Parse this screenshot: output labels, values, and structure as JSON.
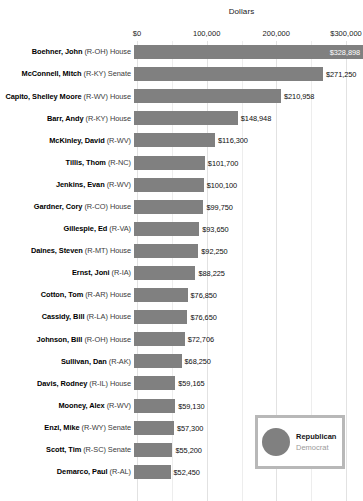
{
  "chart_data": {
    "type": "bar",
    "orientation": "horizontal",
    "title": "Dollars",
    "xlabel": "Dollars",
    "ylabel": "",
    "xlim": [
      0,
      300000
    ],
    "grid": true,
    "axis_position": "top",
    "tick_labels": [
      "$0",
      "100,000",
      "200,000",
      "$300,000"
    ],
    "tick_values": [
      0,
      100000,
      200000,
      300000
    ],
    "legend": {
      "position": "bottom-right",
      "entries": [
        {
          "label": "Republican",
          "color": "#808080",
          "active": true
        },
        {
          "label": "Democrat",
          "color": "#c8c8c8",
          "active": false
        }
      ]
    },
    "categories": [
      "Boehner, John (R-OH) House",
      "McConnell, Mitch (R-KY) Senate",
      "Capito, Shelley Moore (R-WV) House",
      "Barr, Andy (R-KY) House",
      "McKinley, David (R-WV)",
      "Tillis, Thom (R-NC)",
      "Jenkins, Evan (R-WV)",
      "Gardner, Cory (R-CO) House",
      "Gillespie, Ed (R-VA)",
      "Daines, Steven (R-MT) House",
      "Ernst, Joni (R-IA)",
      "Cotton, Tom (R-AR) House",
      "Cassidy, Bill (R-LA) House",
      "Johnson, Bill (R-OH) House",
      "Sullivan, Dan (R-AK)",
      "Davis, Rodney (R-IL) House",
      "Mooney, Alex (R-WV)",
      "Enzi, Mike (R-WY) Senate",
      "Scott, Tim (R-SC) Senate",
      "Demarco, Paul (R-AL)"
    ],
    "values": [
      328898,
      271250,
      210958,
      148948,
      116300,
      101700,
      100100,
      99750,
      93650,
      92250,
      88225,
      76850,
      76650,
      72706,
      68250,
      59165,
      59130,
      57300,
      55200,
      52450
    ],
    "value_labels": [
      "$328,898",
      "$271,250",
      "$210,958",
      "$148,948",
      "$116,300",
      "$101,700",
      "$100,100",
      "$99,750",
      "$93,650",
      "$92,250",
      "$88,225",
      "$76,850",
      "$76,650",
      "$72,706",
      "$68,250",
      "$59,165",
      "$59,130",
      "$57,300",
      "$55,200",
      "$52,450"
    ],
    "bar_color": "#808080"
  },
  "rows": [
    {
      "name": "Boehner, John",
      "party": "(R-OH) House",
      "value": 328898,
      "value_label": "$328,898",
      "label_inside": true
    },
    {
      "name": "McConnell, Mitch",
      "party": "(R-KY) Senate",
      "value": 271250,
      "value_label": "$271,250",
      "label_inside": false
    },
    {
      "name": "Capito, Shelley Moore",
      "party": "(R-WV) House",
      "value": 210958,
      "value_label": "$210,958",
      "label_inside": false
    },
    {
      "name": "Barr, Andy",
      "party": "(R-KY) House",
      "value": 148948,
      "value_label": "$148,948",
      "label_inside": false
    },
    {
      "name": "McKinley, David",
      "party": "(R-WV)",
      "value": 116300,
      "value_label": "$116,300",
      "label_inside": false
    },
    {
      "name": "Tillis, Thom",
      "party": "(R-NC)",
      "value": 101700,
      "value_label": "$101,700",
      "label_inside": false
    },
    {
      "name": "Jenkins, Evan",
      "party": "(R-WV)",
      "value": 100100,
      "value_label": "$100,100",
      "label_inside": false
    },
    {
      "name": "Gardner, Cory",
      "party": "(R-CO) House",
      "value": 99750,
      "value_label": "$99,750",
      "label_inside": false
    },
    {
      "name": "Gillespie, Ed",
      "party": "(R-VA)",
      "value": 93650,
      "value_label": "$93,650",
      "label_inside": false
    },
    {
      "name": "Daines, Steven",
      "party": "(R-MT) House",
      "value": 92250,
      "value_label": "$92,250",
      "label_inside": false
    },
    {
      "name": "Ernst, Joni",
      "party": "(R-IA)",
      "value": 88225,
      "value_label": "$88,225",
      "label_inside": false
    },
    {
      "name": "Cotton, Tom",
      "party": "(R-AR) House",
      "value": 76850,
      "value_label": "$76,850",
      "label_inside": false
    },
    {
      "name": "Cassidy, Bill",
      "party": "(R-LA) House",
      "value": 76650,
      "value_label": "$76,650",
      "label_inside": false
    },
    {
      "name": "Johnson, Bill",
      "party": "(R-OH) House",
      "value": 72706,
      "value_label": "$72,706",
      "label_inside": false
    },
    {
      "name": "Sullivan, Dan",
      "party": "(R-AK)",
      "value": 68250,
      "value_label": "$68,250",
      "label_inside": false
    },
    {
      "name": "Davis, Rodney",
      "party": "(R-IL) House",
      "value": 59165,
      "value_label": "$59,165",
      "label_inside": false
    },
    {
      "name": "Mooney, Alex",
      "party": "(R-WV)",
      "value": 59130,
      "value_label": "$59,130",
      "label_inside": false
    },
    {
      "name": "Enzi, Mike",
      "party": "(R-WY) Senate",
      "value": 57300,
      "value_label": "$57,300",
      "label_inside": false
    },
    {
      "name": "Scott, Tim",
      "party": "(R-SC) Senate",
      "value": 55200,
      "value_label": "$55,200",
      "label_inside": false
    },
    {
      "name": "Demarco, Paul",
      "party": "(R-AL)",
      "value": 52450,
      "value_label": "$52,450",
      "label_inside": false
    }
  ]
}
